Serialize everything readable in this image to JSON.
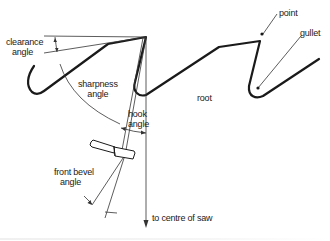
{
  "diagram": {
    "labels": {
      "clearance_angle": [
        "clearance",
        "angle"
      ],
      "sharpness_angle": [
        "sharpness",
        "angle"
      ],
      "hook_angle": [
        "hook",
        "angle"
      ],
      "front_bevel_angle": [
        "front bevel",
        "angle"
      ],
      "point": "point",
      "gullet": "gullet",
      "root": "root",
      "to_centre": "to centre of saw"
    },
    "colors": {
      "outline": "#1a1a1a",
      "construction": "#333333",
      "background": "#ffffff"
    }
  }
}
